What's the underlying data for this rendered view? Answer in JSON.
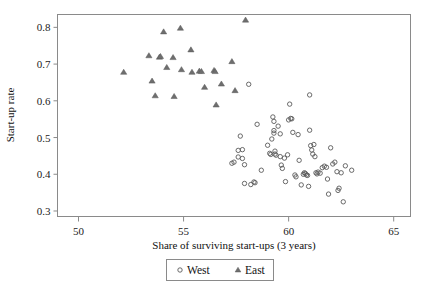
{
  "chart_data": {
    "type": "scatter",
    "title": "",
    "xlabel": "Share of surviving start-ups (3 years)",
    "ylabel": "Start-up rate",
    "xlim": [
      49,
      65.8
    ],
    "ylim": [
      0.285,
      0.835
    ],
    "xticks": [
      50,
      55,
      60,
      65
    ],
    "yticks": [
      0.3,
      0.4,
      0.5,
      0.6,
      0.7,
      0.8
    ],
    "xtick_labels": [
      "50",
      "55",
      "60",
      "65"
    ],
    "ytick_labels": [
      "0.3",
      "0.4",
      "0.5",
      "0.6",
      "0.7",
      "0.8"
    ],
    "grid": false,
    "legend_position": "below-center",
    "marker_color": "#5a5a5a",
    "frame_color": "#8a8a8a",
    "series": [
      {
        "name": "West",
        "marker": "circle",
        "points": [
          [
            57.3,
            0.43
          ],
          [
            57.4,
            0.433
          ],
          [
            57.6,
            0.447
          ],
          [
            57.6,
            0.465
          ],
          [
            57.7,
            0.504
          ],
          [
            57.8,
            0.467
          ],
          [
            57.8,
            0.443
          ],
          [
            57.9,
            0.426
          ],
          [
            57.9,
            0.375
          ],
          [
            58.2,
            0.372
          ],
          [
            58.35,
            0.379
          ],
          [
            58.4,
            0.377
          ],
          [
            58.5,
            0.536
          ],
          [
            58.7,
            0.411
          ],
          [
            59.0,
            0.479
          ],
          [
            59.1,
            0.457
          ],
          [
            59.15,
            0.454
          ],
          [
            59.2,
            0.496
          ],
          [
            59.25,
            0.556
          ],
          [
            59.3,
            0.544
          ],
          [
            59.3,
            0.519
          ],
          [
            59.3,
            0.512
          ],
          [
            59.35,
            0.463
          ],
          [
            59.35,
            0.455
          ],
          [
            59.4,
            0.452
          ],
          [
            59.5,
            0.531
          ],
          [
            59.6,
            0.51
          ],
          [
            59.6,
            0.448
          ],
          [
            59.65,
            0.425
          ],
          [
            59.7,
            0.416
          ],
          [
            59.8,
            0.444
          ],
          [
            59.85,
            0.38
          ],
          [
            59.95,
            0.453
          ],
          [
            60.0,
            0.548
          ],
          [
            60.05,
            0.591
          ],
          [
            60.1,
            0.552
          ],
          [
            60.15,
            0.551
          ],
          [
            60.2,
            0.514
          ],
          [
            60.3,
            0.398
          ],
          [
            60.35,
            0.393
          ],
          [
            60.45,
            0.508
          ],
          [
            60.5,
            0.438
          ],
          [
            60.6,
            0.371
          ],
          [
            60.7,
            0.4
          ],
          [
            60.75,
            0.404
          ],
          [
            60.8,
            0.402
          ],
          [
            60.85,
            0.398
          ],
          [
            60.9,
            0.397
          ],
          [
            60.95,
            0.367
          ],
          [
            61.0,
            0.52
          ],
          [
            61.0,
            0.616
          ],
          [
            61.05,
            0.478
          ],
          [
            61.1,
            0.466
          ],
          [
            61.15,
            0.455
          ],
          [
            61.2,
            0.481
          ],
          [
            61.25,
            0.448
          ],
          [
            61.3,
            0.404
          ],
          [
            61.35,
            0.401
          ],
          [
            61.4,
            0.406
          ],
          [
            61.5,
            0.403
          ],
          [
            61.6,
            0.418
          ],
          [
            61.7,
            0.422
          ],
          [
            61.8,
            0.419
          ],
          [
            61.85,
            0.387
          ],
          [
            61.9,
            0.346
          ],
          [
            62.0,
            0.472
          ],
          [
            62.1,
            0.428
          ],
          [
            62.2,
            0.433
          ],
          [
            62.3,
            0.407
          ],
          [
            62.35,
            0.356
          ],
          [
            62.4,
            0.362
          ],
          [
            62.5,
            0.404
          ],
          [
            62.6,
            0.325
          ],
          [
            62.7,
            0.423
          ],
          [
            63.0,
            0.411
          ],
          [
            58.1,
            0.645
          ]
        ]
      },
      {
        "name": "East",
        "marker": "triangle",
        "points": [
          [
            52.15,
            0.678
          ],
          [
            53.35,
            0.723
          ],
          [
            53.5,
            0.654
          ],
          [
            53.65,
            0.614
          ],
          [
            53.85,
            0.719
          ],
          [
            53.9,
            0.721
          ],
          [
            54.05,
            0.788
          ],
          [
            54.2,
            0.691
          ],
          [
            54.5,
            0.718
          ],
          [
            54.55,
            0.612
          ],
          [
            54.85,
            0.798
          ],
          [
            54.9,
            0.685
          ],
          [
            55.35,
            0.739
          ],
          [
            55.4,
            0.678
          ],
          [
            55.75,
            0.681
          ],
          [
            55.85,
            0.68
          ],
          [
            56.0,
            0.637
          ],
          [
            56.45,
            0.683
          ],
          [
            56.5,
            0.68
          ],
          [
            56.55,
            0.589
          ],
          [
            56.8,
            0.646
          ],
          [
            57.3,
            0.707
          ],
          [
            57.45,
            0.628
          ],
          [
            57.95,
            0.82
          ]
        ]
      }
    ]
  },
  "axes": {
    "ylabel": "Start-up rate",
    "xlabel": "Share of surviving start-ups (3 years)"
  },
  "legend": {
    "entries": [
      {
        "label": "West",
        "marker": "circle-marker"
      },
      {
        "label": "East",
        "marker": "triangle-marker"
      }
    ]
  }
}
